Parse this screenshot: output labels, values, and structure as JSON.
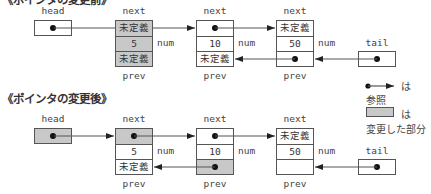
{
  "colors": {
    "changed_fill": "#c8c8c8",
    "line": "#555555",
    "pointer": "#111111",
    "background": "#ffffff"
  },
  "before": {
    "title": "《ポインタの変更前》",
    "head_label": "head",
    "tail_label": "tail",
    "nodes": [
      {
        "top_label": "next",
        "next": "未定義",
        "num": "5",
        "num_label": "num",
        "prev": "未定義",
        "bottom_label": "prev"
      },
      {
        "top_label": "next",
        "next": "",
        "num": "10",
        "num_label": "num",
        "prev": "未定義",
        "bottom_label": "prev"
      },
      {
        "top_label": "next",
        "next": "未定義",
        "num": "50",
        "num_label": "num",
        "prev": "",
        "bottom_label": "prev"
      }
    ]
  },
  "after": {
    "title": "《ポインタの変更後》",
    "head_label": "head",
    "tail_label": "tail",
    "nodes": [
      {
        "top_label": "next",
        "next": "",
        "num": "5",
        "num_label": "num",
        "prev": "未定義",
        "bottom_label": "prev"
      },
      {
        "top_label": "next",
        "next": "",
        "num": "10",
        "num_label": "num",
        "prev": "",
        "bottom_label": "prev"
      },
      {
        "top_label": "next",
        "next": "未定義",
        "num": "50",
        "num_label": "num",
        "prev": "",
        "bottom_label": "prev"
      }
    ]
  },
  "legend": {
    "arrow_suffix": "は",
    "arrow_meaning": "参照",
    "box_suffix": "は",
    "box_meaning": "変更した部分"
  }
}
